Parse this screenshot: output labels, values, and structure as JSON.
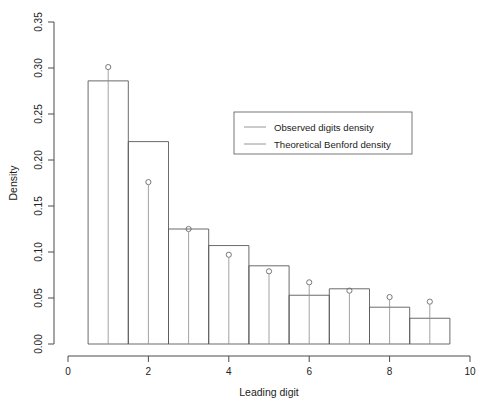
{
  "chart_data": {
    "type": "bar",
    "title": "",
    "xlabel": "Leading digit",
    "ylabel": "Density",
    "xlim": [
      0,
      10
    ],
    "ylim": [
      0.0,
      0.35
    ],
    "grid": false,
    "xticks": [
      "0",
      "2",
      "4",
      "6",
      "8",
      "10"
    ],
    "xtick_values": [
      0,
      2,
      4,
      6,
      8,
      10
    ],
    "yticks": [
      "0.00",
      "0.05",
      "0.10",
      "0.15",
      "0.20",
      "0.25",
      "0.30",
      "0.35"
    ],
    "ytick_values": [
      0.0,
      0.05,
      0.1,
      0.15,
      0.2,
      0.25,
      0.3,
      0.35
    ],
    "categories": [
      1,
      2,
      3,
      4,
      5,
      6,
      7,
      8,
      9
    ],
    "bin_edges": [
      0.5,
      1.5,
      2.5,
      3.5,
      4.5,
      5.5,
      6.5,
      7.5,
      8.5,
      9.5
    ],
    "series": [
      {
        "name": "Observed digits density",
        "style": "histogram-bars",
        "values": [
          0.286,
          0.22,
          0.125,
          0.107,
          0.085,
          0.053,
          0.06,
          0.04,
          0.028
        ]
      },
      {
        "name": "Theoretical Benford density",
        "style": "stem-points",
        "values": [
          0.301,
          0.176,
          0.125,
          0.097,
          0.079,
          0.067,
          0.058,
          0.051,
          0.046
        ]
      }
    ],
    "legend": {
      "position": "upper-right-inset",
      "entries": [
        "Observed digits density",
        "Theoretical Benford density"
      ]
    },
    "colors": {
      "bar_stroke": "#5a5a5a",
      "stem": "#8a8a8a",
      "point": "#6a6a6a",
      "axis": "#4a4a4a",
      "text": "#222222",
      "background": "#ffffff"
    }
  }
}
